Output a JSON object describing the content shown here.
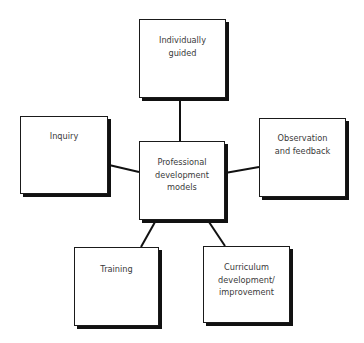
{
  "diagram": {
    "title": "",
    "center": {
      "id": "center",
      "label": "Professional development models",
      "lines": [
        "Professional",
        "development",
        "models"
      ]
    },
    "nodes": [
      {
        "id": "individually-guided",
        "label": "Individually guided",
        "lines": [
          "Individually",
          "guided"
        ]
      },
      {
        "id": "inquiry",
        "label": "Inquiry",
        "lines": [
          "Inquiry"
        ]
      },
      {
        "id": "observation-feedback",
        "label": "Observation and feedback",
        "lines": [
          "Observation",
          "and feedback"
        ]
      },
      {
        "id": "training",
        "label": "Training",
        "lines": [
          "Training"
        ]
      },
      {
        "id": "curriculum",
        "label": "Curriculum development/ improvement",
        "lines": [
          "Curriculum",
          "development/",
          "improvement"
        ]
      }
    ],
    "edges": [
      {
        "from": "center",
        "to": "individually-guided"
      },
      {
        "from": "center",
        "to": "inquiry"
      },
      {
        "from": "center",
        "to": "observation-feedback"
      },
      {
        "from": "center",
        "to": "training"
      },
      {
        "from": "center",
        "to": "curriculum"
      }
    ],
    "colors": {
      "border": "#1a1a1a",
      "shadow": "#111111",
      "text": "#3a3a3a",
      "background": "#ffffff"
    }
  }
}
